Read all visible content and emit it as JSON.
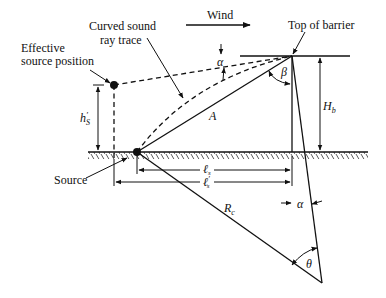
{
  "labels": {
    "curved_ray_line1": "Curved sound",
    "curved_ray_line2": "ray trace",
    "effective_source_line1": "Effective",
    "effective_source_line2": "source position",
    "wind": "Wind",
    "top_of_barrier": "Top of barrier",
    "source": "Source",
    "alpha_top": "α",
    "alpha_bottom": "α",
    "beta": "β",
    "theta": "θ",
    "A": "A",
    "Rc_main": "R",
    "Rc_sub": "c",
    "Hb_main": "H",
    "Hb_sub": "b",
    "hs_main": "h",
    "hs_prime": "′",
    "hs_sub": "S",
    "ls_main": "ℓ",
    "ls_sub": "s",
    "lsp_main": "ℓ",
    "lsp_prime": "′",
    "lsp_sub": "s"
  },
  "colors": {
    "stroke": "#111111",
    "background": "#ffffff"
  }
}
